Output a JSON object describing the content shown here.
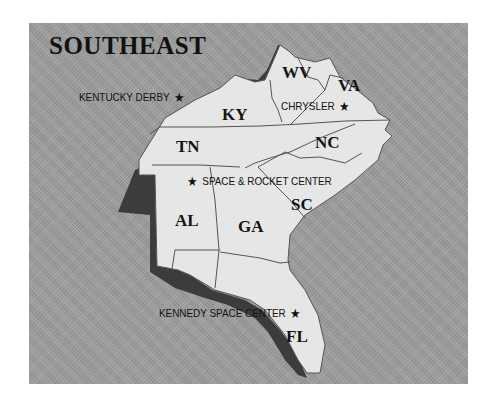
{
  "map": {
    "title": "SOUTHEAST",
    "colors": {
      "background": "#9c9c9c",
      "land": "#e6e6e6",
      "shadow": "#3c3c3c",
      "border": "#555555",
      "text": "#111111"
    },
    "states": [
      {
        "abbr": "WV"
      },
      {
        "abbr": "VA"
      },
      {
        "abbr": "KY"
      },
      {
        "abbr": "TN"
      },
      {
        "abbr": "NC"
      },
      {
        "abbr": "SC"
      },
      {
        "abbr": "AL"
      },
      {
        "abbr": "GA"
      },
      {
        "abbr": "FL"
      }
    ],
    "landmarks": [
      {
        "label": "KENTUCKY DERBY",
        "icon": "star-icon",
        "star_side": "right",
        "state": "KY"
      },
      {
        "label": "CHRYSLER",
        "icon": "star-icon",
        "star_side": "right",
        "state": "VA"
      },
      {
        "label": "SPACE & ROCKET CENTER",
        "icon": "star-icon",
        "star_side": "left",
        "state": "AL"
      },
      {
        "label": "KENNEDY SPACE CENTER",
        "icon": "star-icon",
        "star_side": "right",
        "state": "FL"
      }
    ],
    "star_glyph": "★"
  }
}
